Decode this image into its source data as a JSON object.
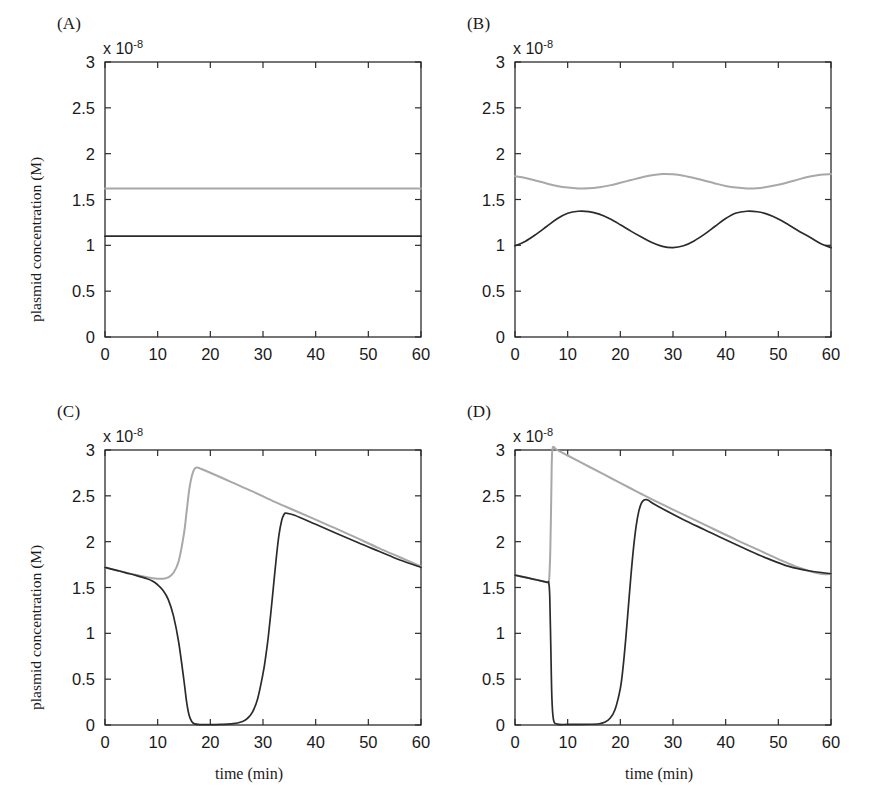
{
  "figure": {
    "axis_exponent_prefix": "x 10",
    "axis_exponent_power": "-8",
    "ylabel": "plasmid concentration (M)",
    "xlabel": "time (min)",
    "xticks": [
      "0",
      "10",
      "20",
      "30",
      "40",
      "50",
      "60"
    ],
    "yticks": [
      "0",
      "0.5",
      "1",
      "1.5",
      "2",
      "2.5",
      "3"
    ],
    "colors": {
      "black_series": "#2b2b2b",
      "gray_series": "#a8a8a8",
      "axis": "#2b2b2b"
    }
  },
  "panels": [
    {
      "id": "A",
      "label": "(A)",
      "show_xlabel": false,
      "show_ylabel": true
    },
    {
      "id": "B",
      "label": "(B)",
      "show_xlabel": false,
      "show_ylabel": false
    },
    {
      "id": "C",
      "label": "(C)",
      "show_xlabel": true,
      "show_ylabel": true
    },
    {
      "id": "D",
      "label": "(D)",
      "show_xlabel": true,
      "show_ylabel": false
    }
  ],
  "chart_data": [
    {
      "type": "line",
      "panel": "A",
      "title": "(A)",
      "xlabel": "",
      "ylabel": "plasmid concentration (M)",
      "xlim": [
        0,
        60
      ],
      "ylim": [
        0,
        3
      ],
      "y_scale_exponent": -8,
      "grid": false,
      "legend": "none",
      "series": [
        {
          "name": "gray",
          "color": "#a8a8a8",
          "x": [
            0,
            5,
            10,
            15,
            20,
            25,
            30,
            35,
            40,
            45,
            50,
            55,
            60
          ],
          "values": [
            1.62,
            1.62,
            1.62,
            1.62,
            1.62,
            1.62,
            1.62,
            1.62,
            1.62,
            1.62,
            1.62,
            1.62,
            1.62
          ]
        },
        {
          "name": "black",
          "color": "#2b2b2b",
          "x": [
            0,
            5,
            10,
            15,
            20,
            25,
            30,
            35,
            40,
            45,
            50,
            55,
            60
          ],
          "values": [
            1.1,
            1.1,
            1.1,
            1.1,
            1.1,
            1.1,
            1.1,
            1.1,
            1.1,
            1.1,
            1.1,
            1.1,
            1.1
          ]
        }
      ]
    },
    {
      "type": "line",
      "panel": "B",
      "title": "(B)",
      "xlabel": "",
      "ylabel": "",
      "xlim": [
        0,
        60
      ],
      "ylim": [
        0,
        3
      ],
      "y_scale_exponent": -8,
      "grid": false,
      "legend": "none",
      "series": [
        {
          "name": "gray",
          "color": "#a8a8a8",
          "x": [
            0,
            2,
            4,
            6,
            8,
            10,
            12,
            14,
            16,
            18,
            20,
            22,
            24,
            26,
            28,
            30,
            32,
            34,
            36,
            38,
            40,
            42,
            44,
            46,
            48,
            50,
            52,
            54,
            56,
            58,
            60
          ],
          "values": [
            1.755,
            1.735,
            1.705,
            1.675,
            1.648,
            1.63,
            1.621,
            1.622,
            1.634,
            1.654,
            1.682,
            1.712,
            1.741,
            1.765,
            1.778,
            1.775,
            1.76,
            1.735,
            1.705,
            1.675,
            1.648,
            1.63,
            1.621,
            1.624,
            1.638,
            1.66,
            1.69,
            1.722,
            1.75,
            1.77,
            1.778
          ]
        },
        {
          "name": "black",
          "color": "#2b2b2b",
          "x": [
            0,
            2,
            4,
            6,
            8,
            10,
            12,
            14,
            16,
            18,
            20,
            22,
            24,
            26,
            28,
            30,
            32,
            34,
            36,
            38,
            40,
            42,
            44,
            46,
            48,
            50,
            52,
            54,
            56,
            58,
            60
          ],
          "values": [
            0.995,
            1.045,
            1.12,
            1.205,
            1.29,
            1.35,
            1.372,
            1.368,
            1.34,
            1.29,
            1.225,
            1.155,
            1.09,
            1.03,
            0.988,
            0.975,
            0.995,
            1.048,
            1.122,
            1.208,
            1.292,
            1.352,
            1.372,
            1.366,
            1.338,
            1.288,
            1.222,
            1.152,
            1.088,
            1.02,
            0.975
          ]
        }
      ]
    },
    {
      "type": "line",
      "panel": "C",
      "title": "(C)",
      "xlabel": "time (min)",
      "ylabel": "plasmid concentration (M)",
      "xlim": [
        0,
        60
      ],
      "ylim": [
        0,
        3
      ],
      "y_scale_exponent": -8,
      "grid": false,
      "legend": "none",
      "series": [
        {
          "name": "gray",
          "color": "#a8a8a8",
          "x": [
            0,
            2,
            4,
            6,
            8,
            10,
            11,
            12,
            13,
            14,
            15,
            15.5,
            16,
            16.5,
            17,
            17.5,
            18,
            20,
            24,
            28,
            32,
            34,
            36,
            40,
            44,
            48,
            52,
            56,
            60
          ],
          "values": [
            1.72,
            1.69,
            1.662,
            1.636,
            1.612,
            1.596,
            1.596,
            1.61,
            1.66,
            1.79,
            2.09,
            2.33,
            2.57,
            2.72,
            2.795,
            2.81,
            2.8,
            2.752,
            2.65,
            2.548,
            2.44,
            2.39,
            2.34,
            2.24,
            2.14,
            2.035,
            1.93,
            1.83,
            1.73
          ]
        },
        {
          "name": "black",
          "color": "#2b2b2b",
          "x": [
            0,
            2,
            4,
            6,
            8,
            9,
            10,
            11,
            12,
            13,
            14,
            15,
            15.5,
            16,
            16.5,
            17,
            18,
            20,
            22,
            24,
            26,
            27,
            28,
            29,
            30,
            30.5,
            31,
            31.5,
            32,
            32.5,
            33,
            33.5,
            34,
            34.5,
            36,
            40,
            44,
            48,
            52,
            56,
            60
          ],
          "values": [
            1.72,
            1.69,
            1.66,
            1.63,
            1.595,
            1.57,
            1.53,
            1.47,
            1.37,
            1.19,
            0.9,
            0.48,
            0.25,
            0.1,
            0.035,
            0.012,
            0.005,
            0.004,
            0.006,
            0.012,
            0.035,
            0.07,
            0.14,
            0.29,
            0.56,
            0.74,
            0.96,
            1.23,
            1.52,
            1.81,
            2.06,
            2.22,
            2.3,
            2.31,
            2.288,
            2.19,
            2.09,
            1.99,
            1.895,
            1.8,
            1.72
          ]
        }
      ]
    },
    {
      "type": "line",
      "panel": "D",
      "title": "(D)",
      "xlabel": "time (min)",
      "ylabel": "",
      "xlim": [
        0,
        60
      ],
      "ylim": [
        0,
        3
      ],
      "y_scale_exponent": -8,
      "grid": false,
      "legend": "none",
      "series": [
        {
          "name": "gray",
          "color": "#a8a8a8",
          "x": [
            0,
            2,
            4,
            6,
            6.3,
            6.5,
            6.7,
            6.9,
            7.0,
            7.2,
            8,
            10,
            14,
            18,
            22,
            24,
            26,
            30,
            34,
            38,
            42,
            46,
            50,
            54,
            58,
            60
          ],
          "values": [
            1.635,
            1.61,
            1.585,
            1.558,
            1.555,
            1.6,
            1.9,
            2.55,
            2.9,
            3.03,
            3.0,
            2.94,
            2.82,
            2.7,
            2.58,
            2.52,
            2.462,
            2.35,
            2.24,
            2.13,
            2.02,
            1.915,
            1.81,
            1.715,
            1.65,
            1.65
          ]
        },
        {
          "name": "black",
          "color": "#2b2b2b",
          "x": [
            0,
            2,
            4,
            6,
            6.4,
            6.6,
            6.8,
            7.0,
            7.3,
            8,
            10,
            14,
            16,
            17,
            18,
            19,
            20,
            20.5,
            21,
            21.5,
            22,
            22.5,
            23,
            23.5,
            24,
            24.5,
            25,
            25.5,
            26,
            28,
            32,
            36,
            40,
            44,
            48,
            52,
            56,
            60
          ],
          "values": [
            1.635,
            1.61,
            1.585,
            1.558,
            1.552,
            1.4,
            0.85,
            0.3,
            0.06,
            0.01,
            0.006,
            0.008,
            0.014,
            0.03,
            0.07,
            0.17,
            0.4,
            0.62,
            0.92,
            1.27,
            1.62,
            1.93,
            2.17,
            2.33,
            2.42,
            2.455,
            2.458,
            2.445,
            2.425,
            2.36,
            2.24,
            2.13,
            2.02,
            1.915,
            1.815,
            1.73,
            1.68,
            1.65
          ]
        }
      ]
    }
  ]
}
